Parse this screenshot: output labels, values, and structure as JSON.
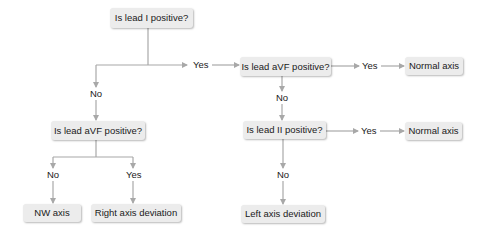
{
  "diagram": {
    "type": "flowchart",
    "title": "",
    "colors": {
      "node_fill": "#ececec",
      "edge": "#a8a8a8",
      "text": "#1a1a1a",
      "background": "#ffffff"
    },
    "nodes": {
      "q_lead1": "Is lead I positive?",
      "q_avf_right": "Is lead aVF positive?",
      "normal_axis_1": "Normal axis",
      "q_lead2": "Is lead II positive?",
      "normal_axis_2": "Normal axis",
      "left_axis_deviation": "Left axis deviation",
      "q_avf_left": "Is lead aVF positive?",
      "nw_axis": "NW axis",
      "right_axis_deviation": "Right axis deviation"
    },
    "edge_labels": {
      "lead1_yes": "Yes",
      "lead1_no": "No",
      "avf_right_yes": "Yes",
      "avf_right_no": "No",
      "lead2_yes": "Yes",
      "lead2_no": "No",
      "avf_left_no": "No",
      "avf_left_yes": "Yes"
    },
    "edges": [
      {
        "from": "Is lead I positive?",
        "to": "Is lead aVF positive? (right)",
        "label": "Yes"
      },
      {
        "from": "Is lead I positive?",
        "to": "Is lead aVF positive? (left)",
        "label": "No"
      },
      {
        "from": "Is lead aVF positive? (right)",
        "to": "Normal axis",
        "label": "Yes"
      },
      {
        "from": "Is lead aVF positive? (right)",
        "to": "Is lead II positive?",
        "label": "No"
      },
      {
        "from": "Is lead II positive?",
        "to": "Normal axis",
        "label": "Yes"
      },
      {
        "from": "Is lead II positive?",
        "to": "Left axis deviation",
        "label": "No"
      },
      {
        "from": "Is lead aVF positive? (left)",
        "to": "NW axis",
        "label": "No"
      },
      {
        "from": "Is lead aVF positive? (left)",
        "to": "Right axis deviation",
        "label": "Yes"
      }
    ]
  }
}
